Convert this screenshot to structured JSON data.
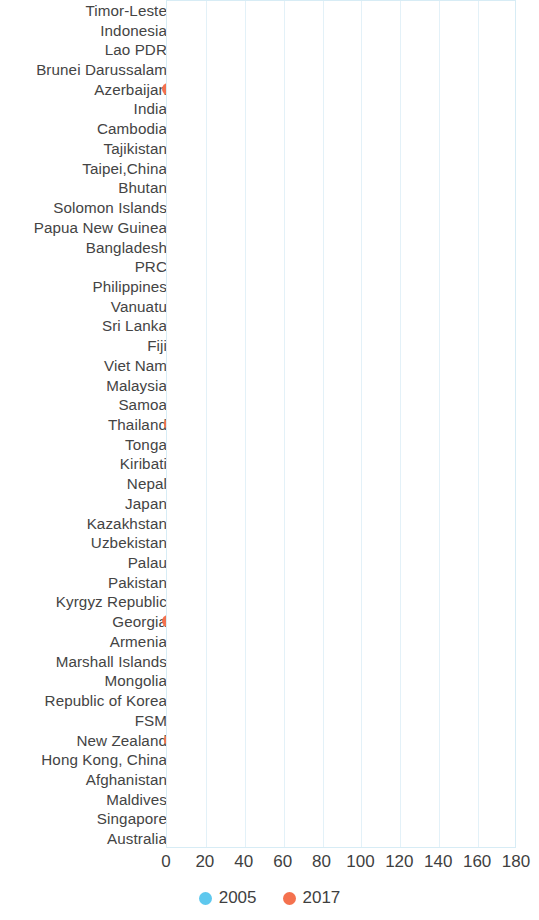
{
  "chart_data": {
    "type": "scatter",
    "title": "",
    "subtitle": "",
    "xlabel": "",
    "ylabel": "",
    "xlim": [
      0,
      180
    ],
    "xticks": [
      0,
      20,
      40,
      60,
      80,
      100,
      120,
      140,
      160,
      180
    ],
    "grid": true,
    "legend_position": "bottom",
    "orientation": "horizontal-dumbbell-arrow",
    "colors": {
      "2005": "#5ec8ee",
      "2017": "#f4714e",
      "arrow": "#7a7a7a"
    },
    "legend": [
      {
        "label": "2005",
        "color": "#5ec8ee"
      },
      {
        "label": "2017",
        "color": "#f4714e"
      }
    ],
    "series": [
      {
        "name": "2005",
        "color": "#5ec8ee"
      },
      {
        "name": "2017",
        "color": "#f4714e"
      }
    ],
    "categories": [
      "Timor-Leste",
      "Indonesia",
      "Lao PDR",
      "Brunei Darussalam",
      "Azerbaijan",
      "India",
      "Cambodia",
      "Tajikistan",
      "Taipei,China",
      "Bhutan",
      "Solomon Islands",
      "Papua New Guinea",
      "Bangladesh",
      "PRC",
      "Philippines",
      "Vanuatu",
      "Sri Lanka",
      "Fiji",
      "Viet Nam",
      "Malaysia",
      "Samoa",
      "Thailand",
      "Tonga",
      "Kiribati",
      "Nepal",
      "Japan",
      "Kazakhstan",
      "Uzbekistan",
      "Palau",
      "Pakistan",
      "Kyrgyz Republic",
      "Georgia",
      "Armenia",
      "Marshall Islands",
      "Mongolia",
      "Republic of Korea",
      "FSM",
      "New Zealand",
      "Hong Kong, China",
      "Afghanistan",
      "Maldives",
      "Singapore",
      "Australia"
    ],
    "points": [
      {
        "category": "Timor-Leste",
        "v2005": 166,
        "v2017": 5
      },
      {
        "category": "Indonesia",
        "v2005": 164,
        "v2017": 23
      },
      {
        "category": "Lao PDR",
        "v2005": 130,
        "v2017": 64
      },
      {
        "category": "Brunei Darussalam",
        "v2005": 119,
        "v2017": 10
      },
      {
        "category": "Azerbaijan",
        "v2005": 111,
        "v2017": 1
      },
      {
        "category": "India",
        "v2005": 95,
        "v2017": 28
      },
      {
        "category": "Cambodia",
        "v2005": 85,
        "v2017": 97
      },
      {
        "category": "Tajikistan",
        "v2005": 77,
        "v2017": 7
      },
      {
        "category": "Taipei,China",
        "v2005": 62,
        "v2017": 7
      },
      {
        "category": "Bhutan",
        "v2005": 60,
        "v2017": 8
      },
      {
        "category": "Solomon Islands",
        "v2005": 53,
        "v2017": 7
      },
      {
        "category": "Papua New Guinea",
        "v2005": 49,
        "v2017": 40
      },
      {
        "category": "Bangladesh",
        "v2005": 48,
        "v2017": 22
      },
      {
        "category": "PRC",
        "v2005": 47,
        "v2017": 23
      },
      {
        "category": "Philippines",
        "v2005": 46,
        "v2017": 20
      },
      {
        "category": "Vanuatu",
        "v2005": 45,
        "v2017": 9
      },
      {
        "category": "Sri Lanka",
        "v2005": 42,
        "v2017": 5
      },
      {
        "category": "Fiji",
        "v2005": 42,
        "v2017": 38
      },
      {
        "category": "Viet Nam",
        "v2005": 37,
        "v2017": 16
      },
      {
        "category": "Malaysia",
        "v2005": 36,
        "v2017": 16
      },
      {
        "category": "Samoa",
        "v2005": 35,
        "v2017": 6
      },
      {
        "category": "Thailand",
        "v2005": 35,
        "v2017": 2
      },
      {
        "category": "Tonga",
        "v2005": 33,
        "v2017": 12
      },
      {
        "category": "Kiribati",
        "v2005": null,
        "v2017": 24
      },
      {
        "category": "Nepal",
        "v2005": 29,
        "v2017": 14
      },
      {
        "category": "Japan",
        "v2005": 27,
        "v2017": 12
      },
      {
        "category": "Kazakhstan",
        "v2005": 26,
        "v2017": 11
      },
      {
        "category": "Uzbekistan",
        "v2005": 25,
        "v2017": 3
      },
      {
        "category": "Palau",
        "v2005": 22,
        "v2017": 26
      },
      {
        "category": "Pakistan",
        "v2005": 21,
        "v2017": 18
      },
      {
        "category": "Kyrgyz Republic",
        "v2005": 18,
        "v2017": 10
      },
      {
        "category": "Georgia",
        "v2005": 17,
        "v2017": 1
      },
      {
        "category": "Armenia",
        "v2005": 16,
        "v2017": 6
      },
      {
        "category": "Marshall Islands",
        "v2005": null,
        "v2017": 14
      },
      {
        "category": "Mongolia",
        "v2005": 14,
        "v2017": 12
      },
      {
        "category": "Republic of Korea",
        "v2005": 13,
        "v2017": 3
      },
      {
        "category": "FSM",
        "v2005": null,
        "v2017": 13
      },
      {
        "category": "New Zealand",
        "v2005": 9,
        "v2017": 2
      },
      {
        "category": "Hong Kong, China",
        "v2005": 8,
        "v2017": 5
      },
      {
        "category": "Afghanistan",
        "v2005": 7,
        "v2017": 3
      },
      {
        "category": "Maldives",
        "v2005": null,
        "v2017": 12
      },
      {
        "category": "Singapore",
        "v2005": 6,
        "v2017": 4
      },
      {
        "category": "Australia",
        "v2005": null,
        "v2017": 3
      }
    ]
  }
}
